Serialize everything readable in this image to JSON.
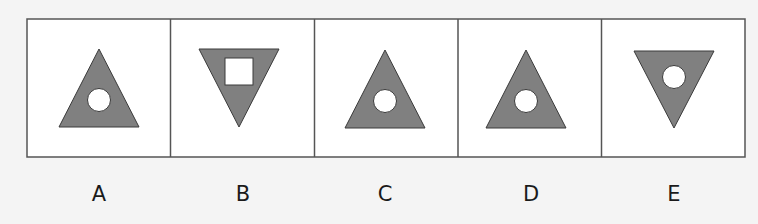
{
  "puzzle": {
    "colors": {
      "background": "#f4f4f4",
      "cell_fill": "#ffffff",
      "border": "#555555",
      "shape_fill": "#808080",
      "shape_stroke": "#3a3a3a",
      "hole_fill": "#ffffff"
    },
    "options": [
      {
        "label": "A",
        "triangle": "up",
        "hole": "circle",
        "hole_position": "lower-center"
      },
      {
        "label": "B",
        "triangle": "down",
        "hole": "square",
        "hole_position": "upper-center"
      },
      {
        "label": "C",
        "triangle": "up",
        "hole": "circle",
        "hole_position": "lower-center"
      },
      {
        "label": "D",
        "triangle": "up",
        "hole": "circle",
        "hole_position": "lower-center"
      },
      {
        "label": "E",
        "triangle": "down",
        "hole": "circle",
        "hole_position": "upper-center"
      }
    ]
  }
}
